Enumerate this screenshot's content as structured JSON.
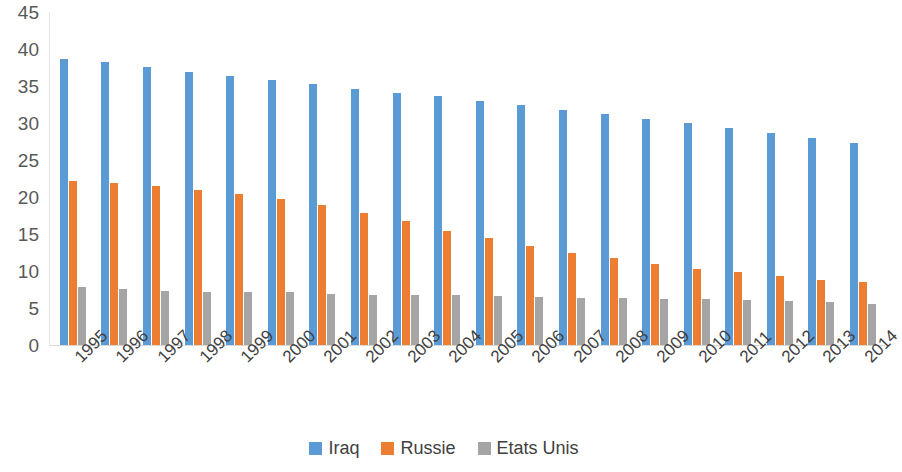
{
  "chart_data": {
    "type": "bar",
    "title": "",
    "subtitle": "",
    "xlabel": "",
    "ylabel": "",
    "ylim": [
      0,
      45
    ],
    "yticks": [
      0,
      5,
      10,
      15,
      20,
      25,
      30,
      35,
      40,
      45
    ],
    "grid": false,
    "legend_position": "bottom",
    "categories": [
      "1995",
      "1996",
      "1997",
      "1998",
      "1999",
      "2000",
      "2001",
      "2002",
      "2003",
      "2004",
      "2005",
      "2006",
      "2007",
      "2008",
      "2009",
      "2010",
      "2011",
      "2012",
      "2013",
      "2014"
    ],
    "series": [
      {
        "name": "Iraq",
        "color": "#5b9bd5",
        "values": [
          38.7,
          38.3,
          37.6,
          36.9,
          36.3,
          35.8,
          35.3,
          34.6,
          34.1,
          33.6,
          33.0,
          32.4,
          31.8,
          31.2,
          30.6,
          30.0,
          29.3,
          28.7,
          28.0,
          27.3
        ]
      },
      {
        "name": "Russie",
        "color": "#ed7d31",
        "values": [
          22.2,
          21.9,
          21.5,
          21.0,
          20.4,
          19.7,
          18.9,
          17.8,
          16.7,
          15.4,
          14.4,
          13.4,
          12.4,
          11.7,
          10.9,
          10.3,
          9.9,
          9.3,
          8.8,
          8.5
        ]
      },
      {
        "name": "Etats Unis",
        "color": "#a5a5a5",
        "values": [
          7.9,
          7.6,
          7.3,
          7.2,
          7.1,
          7.1,
          6.9,
          6.8,
          6.7,
          6.7,
          6.6,
          6.5,
          6.4,
          6.3,
          6.2,
          6.2,
          6.1,
          6.0,
          5.8,
          5.6
        ]
      }
    ]
  }
}
